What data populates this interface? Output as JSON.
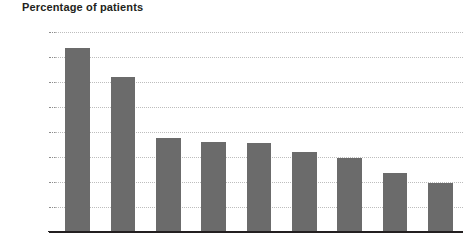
{
  "chart_data": {
    "type": "bar",
    "title": "Percentage of patients",
    "xlabel": "",
    "ylabel": "",
    "ylim": [
      0,
      40
    ],
    "ytick_values": [
      0,
      5,
      10,
      15,
      20,
      25,
      30,
      35,
      40
    ],
    "ytick_labels": [
      "0%",
      "5%",
      "10%",
      "15%",
      "20%",
      "25%",
      "30%",
      "35%",
      "40%"
    ],
    "grid": true,
    "legend": false,
    "bar_color": "#6b6b6b",
    "categories": [
      "",
      "",
      "",
      "",
      "",
      "",
      "",
      "",
      ""
    ],
    "values": [
      36.8,
      31.0,
      18.8,
      18.0,
      17.9,
      16.0,
      14.9,
      11.8,
      9.8
    ],
    "series": [
      {
        "name": "Percentage of patients",
        "values": [
          36.8,
          31.0,
          18.8,
          18.0,
          17.9,
          16.0,
          14.9,
          11.8,
          9.8
        ]
      }
    ]
  }
}
